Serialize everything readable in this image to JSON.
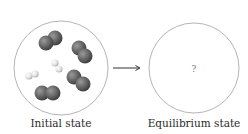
{
  "diagram": {
    "panels": [
      {
        "id": "initial",
        "label": "Initial state",
        "circle": {
          "cx": 61,
          "cy": 68,
          "r": 47,
          "stroke": "#b5b5b5"
        },
        "molecules": [
          {
            "type": "large-diatomic",
            "color": "#6e6e6e",
            "atoms": [
              [
                45,
                40
              ],
              [
                55,
                37
              ]
            ]
          },
          {
            "type": "large-diatomic",
            "color": "#6e6e6e",
            "atoms": [
              [
                77,
                47
              ],
              [
                84,
                55
              ]
            ]
          },
          {
            "type": "small-diatomic",
            "color": "#e6e6e6",
            "atoms": [
              [
                54,
                63
              ],
              [
                59,
                69
              ]
            ]
          },
          {
            "type": "small-diatomic",
            "color": "#e6e6e6",
            "atoms": [
              [
                30,
                76
              ],
              [
                37,
                74
              ]
            ]
          },
          {
            "type": "large-diatomic",
            "color": "#6e6e6e",
            "atoms": [
              [
                73,
                77
              ],
              [
                82,
                85
              ]
            ]
          },
          {
            "type": "large-diatomic",
            "color": "#6e6e6e",
            "atoms": [
              [
                44,
                93
              ],
              [
                55,
                93
              ]
            ]
          }
        ]
      },
      {
        "id": "equilibrium",
        "label": "Equilibrium state",
        "circle": {
          "cx": 194,
          "cy": 68,
          "r": 45,
          "stroke": "#b5b5b5"
        },
        "content": "?"
      }
    ],
    "arrow": {
      "x1": 113,
      "x2": 140,
      "y": 68,
      "color": "#333333"
    }
  },
  "labels": {
    "initial": "Initial state",
    "equilibrium": "Equilibrium state",
    "question_mark": "?"
  }
}
